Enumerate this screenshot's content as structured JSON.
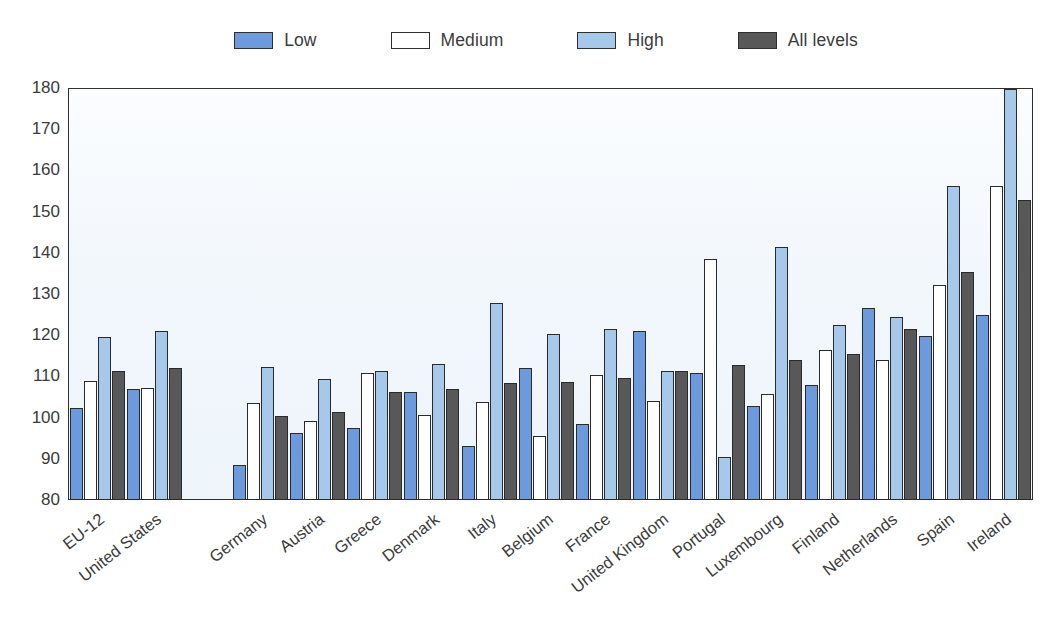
{
  "chart_data": {
    "type": "bar",
    "title": "",
    "subtitle": "",
    "xlabel": "",
    "ylabel": "",
    "ylim": [
      80,
      180
    ],
    "ytick_step": 10,
    "yticks": [
      180,
      170,
      160,
      150,
      140,
      130,
      120,
      110,
      100,
      90,
      80
    ],
    "grid": false,
    "legend_position": "top",
    "legend": [
      "Low",
      "Medium",
      "High",
      "All levels"
    ],
    "series_colors": {
      "Low": "#6b9bdc",
      "Medium": "#ffffff",
      "High": "#a6c8ea",
      "All levels": "#585858"
    },
    "categories": [
      "EU-12",
      "United States",
      "",
      "Germany",
      "Austria",
      "Greece",
      "Denmark",
      "Italy",
      "Belgium",
      "France",
      "United Kingdom",
      "Portugal",
      "Luxembourg",
      "Finland",
      "Netherlands",
      "Spain",
      "Ireland"
    ],
    "series": [
      {
        "name": "Low",
        "values": [
          102.3,
          106.9,
          null,
          88.4,
          96.2,
          97.5,
          106.3,
          93.2,
          112.0,
          98.5,
          121.0,
          110.8,
          102.8,
          108.0,
          126.5,
          119.9,
          124.8
        ]
      },
      {
        "name": "Medium",
        "values": [
          108.8,
          107.2,
          null,
          103.5,
          99.1,
          110.8,
          100.6,
          103.9,
          95.5,
          110.3,
          104.0,
          138.5,
          105.8,
          116.3,
          114.0,
          132.2,
          156.3
        ]
      },
      {
        "name": "High",
        "values": [
          119.6,
          121.1,
          null,
          112.4,
          109.4,
          111.2,
          113.0,
          127.7,
          120.2,
          121.5,
          111.2,
          90.4,
          141.5,
          122.5,
          124.3,
          156.3,
          179.7
        ]
      },
      {
        "name": "All levels",
        "values": [
          111.2,
          112.0,
          null,
          100.5,
          101.3,
          106.2,
          106.9,
          108.3,
          108.6,
          109.6,
          111.3,
          112.8,
          113.9,
          115.4,
          121.6,
          135.3,
          152.8
        ]
      }
    ]
  },
  "legend_items": [
    {
      "label": "Low",
      "color": "#6b9bdc",
      "icon": "legend-swatch-low"
    },
    {
      "label": "Medium",
      "color": "#ffffff",
      "icon": "legend-swatch-medium"
    },
    {
      "label": "High",
      "color": "#a6c8ea",
      "icon": "legend-swatch-high"
    },
    {
      "label": "All levels",
      "color": "#585858",
      "icon": "legend-swatch-all-levels"
    }
  ]
}
